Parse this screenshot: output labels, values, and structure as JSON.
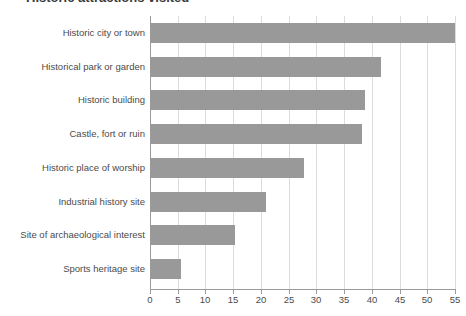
{
  "title_fragment": "Historic attractions visited",
  "chart_data": {
    "type": "bar",
    "orientation": "horizontal",
    "title": "",
    "xlabel": "",
    "ylabel": "",
    "xlim": [
      0,
      55
    ],
    "xticks": [
      0,
      5,
      10,
      15,
      20,
      25,
      30,
      35,
      40,
      45,
      50,
      55
    ],
    "grid": "vertical",
    "legend": "none",
    "bar_color": "#999999",
    "gridline_color": "#dcdcdc",
    "axis_color": "#9a9a9a",
    "categories": [
      "Historic city or town",
      "Historical park or garden",
      "Historic building",
      "Castle, fort or ruin",
      "Historic place of worship",
      "Industrial history site",
      "Site of archaeological interest",
      "Sports heritage site"
    ],
    "values": [
      54.9,
      41.4,
      38.5,
      38.0,
      27.5,
      20.8,
      15.1,
      5.4
    ]
  }
}
